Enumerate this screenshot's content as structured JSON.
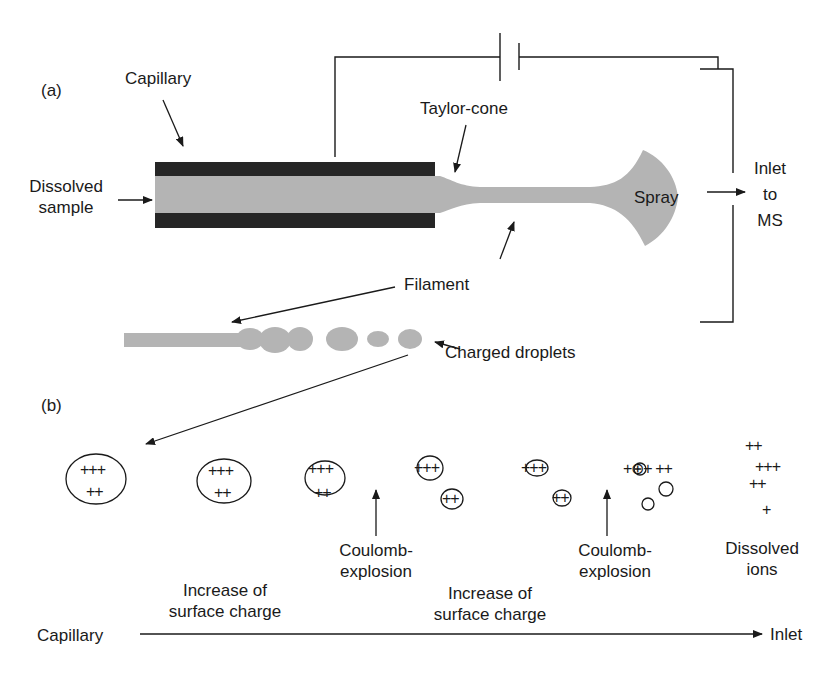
{
  "panel_a": {
    "label": "(a)",
    "capillary": "Capillary",
    "dissolved_sample_1": "Dissolved",
    "dissolved_sample_2": "sample",
    "taylor_cone": "Taylor-cone",
    "spray": "Spray",
    "inlet_1": "Inlet",
    "inlet_2": "to",
    "inlet_3": "MS",
    "filament": "Filament",
    "charged_droplets": "Charged droplets"
  },
  "panel_b": {
    "label": "(b)",
    "droplets": [
      {
        "top": "+++",
        "bottom": "++"
      },
      {
        "top": "+++",
        "bottom": "++"
      },
      {
        "top": "+++",
        "bottom": "++"
      }
    ],
    "after_explosion_1": {
      "big": "+++",
      "small": "++"
    },
    "after_growth_2": {
      "big": "+++",
      "small": "++"
    },
    "after_explosion_2": {
      "row": "+⊕+ ++",
      "small1": "⊕",
      "small2": "⊖"
    },
    "ions": [
      "++",
      "+++",
      "++",
      "+"
    ],
    "coulomb_1_a": "Coulomb-",
    "coulomb_1_b": "explosion",
    "coulomb_2_a": "Coulomb-",
    "coulomb_2_b": "explosion",
    "increase_1_a": "Increase of",
    "increase_1_b": "surface charge",
    "increase_2_a": "Increase of",
    "increase_2_b": "surface charge",
    "dissolved_ions_a": "Dissolved",
    "dissolved_ions_b": "ions",
    "axis_start": "Capillary",
    "axis_end": "Inlet"
  },
  "colors": {
    "ink": "#1a1a1a",
    "capillary_wall": "#262626",
    "liquid": "#b4b4b4"
  }
}
